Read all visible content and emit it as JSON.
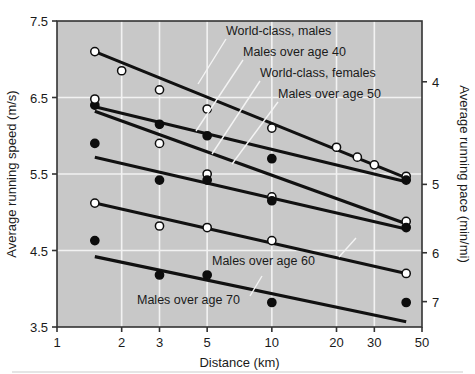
{
  "figure": {
    "background_color": "#ffffff",
    "plot_background_color": "#c8c8c8",
    "grid_color": "#f2f2f2",
    "line_color": "#111111",
    "axis_color": "#333333",
    "footer_rule_color": "#dcdcdc"
  },
  "chart_data": {
    "type": "scatter",
    "title": "",
    "xlabel": "Distance (km)",
    "ylabel": "Average running speed (m/s)",
    "y2label": "Average running pace (min/mi)",
    "xscale": "log",
    "xlim": [
      1,
      50
    ],
    "ylim": [
      3.5,
      7.5
    ],
    "y2lim": [
      7.67,
      3.58
    ],
    "grid": true,
    "legend_position": "inline-annotations",
    "xticks": [
      1,
      2,
      3,
      5,
      10,
      20,
      30,
      50
    ],
    "xticklabels": [
      "1",
      "2",
      "3",
      "5",
      "10",
      "20",
      "30",
      "50"
    ],
    "yticks": [
      3.5,
      4.5,
      5.5,
      6.5,
      7.5
    ],
    "yticklabels": [
      "3.5",
      "4.5",
      "5.5",
      "6.5",
      "7.5"
    ],
    "y2ticks": [
      4,
      5,
      6,
      7
    ],
    "y2ticklabels": [
      "4",
      "5",
      "6",
      "7"
    ],
    "series": [
      {
        "name": "World-class, males",
        "marker": "open-circle",
        "points": [
          {
            "x": 1.5,
            "y": 7.1
          },
          {
            "x": 2.0,
            "y": 6.85
          },
          {
            "x": 3.0,
            "y": 6.6
          },
          {
            "x": 5.0,
            "y": 6.35
          },
          {
            "x": 10.0,
            "y": 6.1
          },
          {
            "x": 20.0,
            "y": 5.85
          },
          {
            "x": 25.0,
            "y": 5.72
          },
          {
            "x": 30.0,
            "y": 5.62
          },
          {
            "x": 42.2,
            "y": 5.47
          }
        ],
        "fit": {
          "x1": 1.5,
          "y1": 7.1,
          "x2": 42.2,
          "y2": 5.45
        }
      },
      {
        "name": "Males over age 40",
        "marker": "filled-circle",
        "points": [
          {
            "x": 1.5,
            "y": 6.4
          },
          {
            "x": 3.0,
            "y": 6.15
          },
          {
            "x": 5.0,
            "y": 6.0
          },
          {
            "x": 10.0,
            "y": 5.7
          },
          {
            "x": 42.2,
            "y": 5.42
          }
        ],
        "fit": {
          "x1": 1.5,
          "y1": 6.38,
          "x2": 42.2,
          "y2": 5.4
        }
      },
      {
        "name": "World-class, females",
        "marker": "open-circle",
        "points": [
          {
            "x": 1.5,
            "y": 6.48
          },
          {
            "x": 3.0,
            "y": 5.9
          },
          {
            "x": 5.0,
            "y": 5.5
          },
          {
            "x": 10.0,
            "y": 5.2
          },
          {
            "x": 42.2,
            "y": 4.88
          }
        ],
        "fit": {
          "x1": 1.5,
          "y1": 6.32,
          "x2": 42.2,
          "y2": 4.85
        }
      },
      {
        "name": "Males over age 50",
        "marker": "filled-circle",
        "points": [
          {
            "x": 1.5,
            "y": 5.9
          },
          {
            "x": 3.0,
            "y": 5.42
          },
          {
            "x": 5.0,
            "y": 5.42
          },
          {
            "x": 10.0,
            "y": 5.15
          },
          {
            "x": 42.2,
            "y": 4.8
          }
        ],
        "fit": {
          "x1": 1.5,
          "y1": 5.72,
          "x2": 42.2,
          "y2": 4.78
        }
      },
      {
        "name": "Males over age 60",
        "marker": "open-circle",
        "points": [
          {
            "x": 1.5,
            "y": 5.12
          },
          {
            "x": 3.0,
            "y": 4.82
          },
          {
            "x": 5.0,
            "y": 4.8
          },
          {
            "x": 10.0,
            "y": 4.63
          },
          {
            "x": 42.2,
            "y": 4.2
          }
        ],
        "fit": {
          "x1": 1.5,
          "y1": 5.12,
          "x2": 42.2,
          "y2": 4.2
        }
      },
      {
        "name": "Males over age 70",
        "marker": "filled-circle",
        "points": [
          {
            "x": 1.5,
            "y": 4.63
          },
          {
            "x": 3.0,
            "y": 4.18
          },
          {
            "x": 5.0,
            "y": 4.18
          },
          {
            "x": 10.0,
            "y": 3.82
          },
          {
            "x": 42.2,
            "y": 3.82
          }
        ],
        "fit": {
          "x1": 1.5,
          "y1": 4.42,
          "x2": 42.2,
          "y2": 3.57
        }
      }
    ],
    "annotations": [
      {
        "text": "World-class, males",
        "anchor": "start",
        "label_x": 226,
        "label_y": 35
      },
      {
        "text": "Males over age 40",
        "anchor": "start",
        "label_x": 243,
        "label_y": 56
      },
      {
        "text": "World-class, females",
        "anchor": "start",
        "label_x": 260,
        "label_y": 77
      },
      {
        "text": "Males over age 50",
        "anchor": "start",
        "label_x": 278,
        "label_y": 98
      },
      {
        "text": "Males over age 60",
        "anchor": "start",
        "label_x": 212,
        "label_y": 265
      },
      {
        "text": "Males over age 70",
        "anchor": "start",
        "label_x": 137,
        "label_y": 304
      }
    ]
  }
}
